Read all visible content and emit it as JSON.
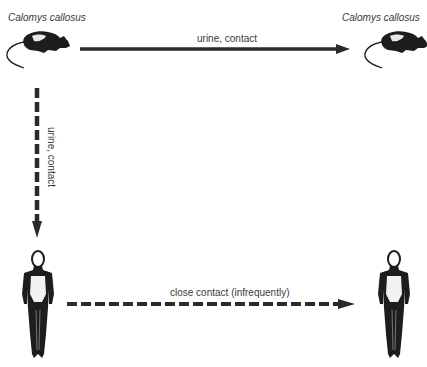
{
  "diagram": {
    "nodes": [
      {
        "id": "rodent_left",
        "label": "Calomys callosus",
        "kind": "rodent"
      },
      {
        "id": "rodent_right",
        "label": "Calomys callosus",
        "kind": "rodent"
      },
      {
        "id": "human_left",
        "label": "",
        "kind": "human"
      },
      {
        "id": "human_right",
        "label": "",
        "kind": "human"
      }
    ],
    "edges": [
      {
        "from": "rodent_left",
        "to": "rodent_right",
        "label": "urine,  contact",
        "style": "solid"
      },
      {
        "from": "rodent_left",
        "to": "human_left",
        "label": "urine,  contact",
        "style": "dashed"
      },
      {
        "from": "human_left",
        "to": "human_right",
        "label": "close contact (infrequently)",
        "style": "dashed"
      }
    ],
    "colors": {
      "arrow": "#2a2a2a",
      "text": "#3a3a3a",
      "background": "#ffffff"
    }
  }
}
